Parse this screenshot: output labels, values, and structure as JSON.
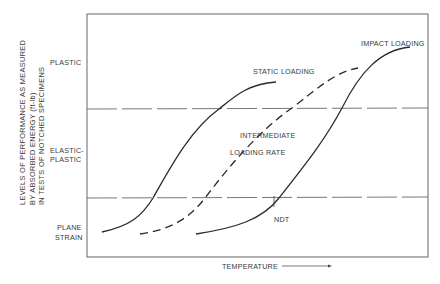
{
  "diagram": {
    "y_axis_title_lines": [
      "LEVELS OF PERFORMANCE AS MEASURED",
      "BY ABSORBED ENERGY (ft-lb)",
      "IN TESTS OF NOTCHED SPECIMENS"
    ],
    "y_levels": {
      "plastic": "PLASTIC",
      "elastic_plastic_1": "ELASTIC-",
      "elastic_plastic_2": "PLASTIC",
      "plane_strain_1": "PLANE",
      "plane_strain_2": "STRAIN"
    },
    "x_axis_title": "TEMPERATURE",
    "curves": {
      "static": "STATIC LOADING",
      "intermediate_1": "INTERMEDIATE",
      "intermediate_2": "LOADING RATE",
      "impact": "IMPACT LOADING"
    },
    "marker": "NDT",
    "colors": {
      "line": "#2b2b2b",
      "frame": "#555555",
      "text": "#3a3a3a"
    }
  }
}
